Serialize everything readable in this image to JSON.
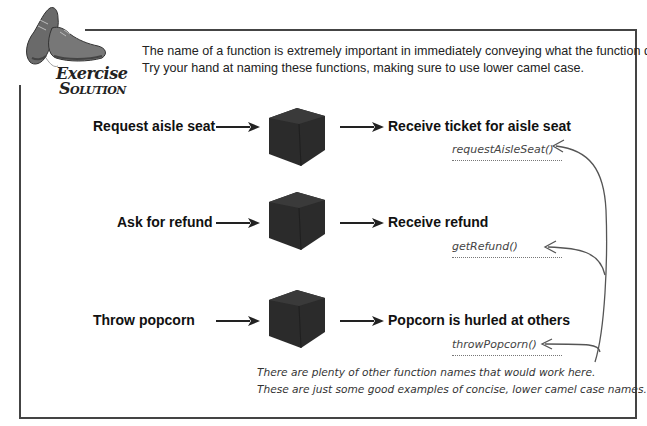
{
  "badge": {
    "icon": "sneakers-icon",
    "line1": "Exercise",
    "line2": "Solution"
  },
  "intro": {
    "line1": "The name of a function is extremely important in immediately conveying what the function does.",
    "line2": "Try your hand at naming these functions, making sure to use lower camel case."
  },
  "rows": [
    {
      "input": "Request aisle seat",
      "output": "Receive ticket for aisle seat",
      "answer": "requestAisleSeat()"
    },
    {
      "input": "Ask for refund",
      "output": "Receive refund",
      "answer": "getRefund()"
    },
    {
      "input": "Throw popcorn",
      "output": "Popcorn is hurled at others",
      "answer": "throwPopcorn()"
    }
  ],
  "note": {
    "line1": "There are plenty of other function names that would work here.",
    "line2": "These are just some good examples of concise, lower camel case names."
  },
  "colors": {
    "frame": "#444444",
    "box": "#2a2a2a",
    "text": "#111111",
    "handwriting": "#444444"
  }
}
